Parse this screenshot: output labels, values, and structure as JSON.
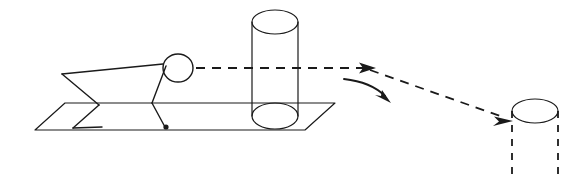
{
  "figure": {
    "title": "Stick figure tossing an object from a source cylinder to a target cylinder",
    "background_color": "#ffffff",
    "line_color": "#1a1a1a",
    "width": 580,
    "height": 192
  },
  "diagram_data": {
    "type": "line-drawing",
    "description": "Schematic side view: a stick figure kneeling on a ground plane beside an upright solid cylinder; a dashed trajectory arrow leaves the figure's head, passes over the cylinder, and terminates at a dashed outline target cylinder on the right. A separate curved arrow indicates the downward placement motion.",
    "elements": [
      {
        "name": "ground-plane",
        "label": "Ground plane",
        "shape": "parallelogram",
        "style": "solid",
        "points": [
          [
            65,
            103
          ],
          [
            335,
            103
          ],
          [
            305,
            130
          ],
          [
            35,
            130
          ]
        ]
      },
      {
        "name": "stick-figure",
        "label": "Stick figure",
        "style": "solid",
        "parts": {
          "head": {
            "cx": 178,
            "cy": 68,
            "rx": 15,
            "ry": 14
          },
          "torso": [
            [
              163,
              64
            ],
            [
              62,
              74
            ]
          ],
          "back_leg_upper": [
            [
              62,
              74
            ],
            [
              99,
              105
            ]
          ],
          "back_leg_lower": [
            [
              99,
              105
            ],
            [
              73,
              128
            ]
          ],
          "foot": [
            [
              73,
              128
            ],
            [
              102,
              127
            ]
          ],
          "neck_to_hip": [
            [
              166,
              66
            ],
            [
              152,
              103
            ]
          ],
          "arm": [
            [
              152,
              103
            ],
            [
              165,
              127
            ]
          ],
          "hand_dot": {
            "cx": 166,
            "cy": 127,
            "r": 2.6
          }
        }
      },
      {
        "name": "source-cylinder",
        "label": "Source cylinder",
        "style": "solid",
        "top_ellipse": {
          "cx": 275,
          "cy": 22,
          "rx": 23,
          "ry": 12
        },
        "bottom_ellipse": {
          "cx": 275,
          "cy": 116,
          "rx": 23,
          "ry": 13
        },
        "left_side": [
          [
            252,
            22
          ],
          [
            252,
            116
          ]
        ],
        "right_side": [
          [
            298,
            22
          ],
          [
            298,
            116
          ]
        ]
      },
      {
        "name": "target-cylinder",
        "label": "Target cylinder",
        "style": "top solid, body dashed",
        "top_ellipse": {
          "cx": 535,
          "cy": 111,
          "rx": 23,
          "ry": 12
        },
        "left_side": [
          [
            512,
            111
          ],
          [
            512,
            180
          ]
        ],
        "right_side": [
          [
            558,
            111
          ],
          [
            558,
            180
          ]
        ]
      },
      {
        "name": "trajectory-arrow-1",
        "label": "Trajectory arrow over cylinder",
        "style": "dashed with solid arrowhead",
        "path": [
          [
            196,
            68
          ],
          [
            375,
            68
          ]
        ],
        "arrowhead_at": [
          375,
          68
        ]
      },
      {
        "name": "trajectory-arrow-2",
        "label": "Trajectory arrow to target",
        "style": "dashed with solid arrowhead",
        "path": [
          [
            372,
            70
          ],
          [
            512,
            120
          ]
        ],
        "arrowhead_at": [
          512,
          120
        ]
      },
      {
        "name": "placement-curve-arrow",
        "label": "Curved placement arrow",
        "style": "solid curve with arrowhead",
        "path": "M 345,79 Q 370,82 390,100",
        "arrowhead_at": [
          390,
          100
        ]
      }
    ]
  }
}
